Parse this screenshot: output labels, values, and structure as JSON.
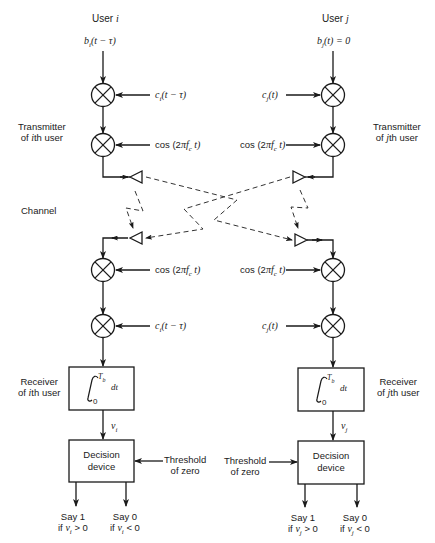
{
  "users": {
    "left": {
      "title": "User i",
      "input_signal": "b_i(t − τ)",
      "code_signal": "c_i(t − τ)",
      "carrier": "cos(2πf_c t)",
      "transmitter_label": [
        "Transmitter",
        "of ith user"
      ],
      "receiver_carrier": "cos(2πf_c t)",
      "receiver_code": "c_i(t − τ)",
      "receiver_label": [
        "Receiver",
        "of ith user"
      ],
      "integrator": {
        "upper": "T_b",
        "lower": "0",
        "integrand": "dt"
      },
      "output_var": "v_i",
      "decision_label": [
        "Decision",
        "device"
      ],
      "threshold_label": [
        "Threshold",
        "of zero"
      ],
      "outputs": [
        {
          "line1": "Say 1",
          "line2": "if v_i > 0"
        },
        {
          "line1": "Say 0",
          "line2": "if v_i < 0"
        }
      ]
    },
    "right": {
      "title": "User j",
      "input_signal": "b_j(t) = 0",
      "code_signal": "c_j(t)",
      "carrier": "cos(2πf_c t)",
      "transmitter_label": [
        "Transmitter",
        "of jth user"
      ],
      "receiver_carrier": "cos(2πf_c t)",
      "receiver_code": "c_j(t)",
      "receiver_label": [
        "Receiver",
        "of jth user"
      ],
      "integrator": {
        "upper": "T_b",
        "lower": "0",
        "integrand": "dt"
      },
      "output_var": "v_j",
      "decision_label": [
        "Decision",
        "device"
      ],
      "threshold_label": [
        "Threshold",
        "of zero"
      ],
      "outputs": [
        {
          "line1": "Say 1",
          "line2": "if v_j > 0"
        },
        {
          "line1": "Say 0",
          "line2": "if v_j < 0"
        }
      ]
    }
  },
  "channel": {
    "label": "Channel"
  },
  "display": {
    "title_left": "User ",
    "title_left_var": "i",
    "title_right": "User ",
    "title_right_var": "j",
    "b_left": "b",
    "b_left_sub": "i",
    "b_left_arg": "(t − τ)",
    "b_right": "b",
    "b_right_sub": "j",
    "b_right_arg": "(t) = 0",
    "c_left": "c",
    "c_left_sub": "i",
    "c_left_arg": "(t − τ)",
    "c_right": "c",
    "c_right_sub": "j",
    "c_right_arg": "(t)",
    "cos_prefix": "cos (2",
    "cos_pi": "π",
    "cos_f": "f",
    "cos_sub": "c",
    "cos_suffix": " t)",
    "tx_left_1": "Transmitter",
    "tx_left_2a": "of ",
    "tx_left_2v": "i",
    "tx_left_2b": "th user",
    "tx_right_1": "Transmitter",
    "tx_right_2a": "of ",
    "tx_right_2v": "j",
    "tx_right_2b": "th user",
    "rx_left_1": "Receiver",
    "rx_left_2a": "of ",
    "rx_left_2v": "i",
    "rx_left_2b": "th user",
    "rx_right_1": "Receiver",
    "rx_right_2a": "of ",
    "rx_right_2v": "j",
    "rx_right_2b": "th user",
    "channel": "Channel",
    "int_upper": "T",
    "int_upper_sub": "b",
    "int_lower": "0",
    "int_dt": "dt",
    "v": "v",
    "v_i_sub": "i",
    "v_j_sub": "j",
    "decision_1": "Decision",
    "decision_2": "device",
    "thr_1": "Threshold",
    "thr_2": "of zero",
    "say1": "Say 1",
    "say0": "Say 0",
    "if": "if ",
    "gt0": " > 0",
    "lt0": " < 0"
  }
}
